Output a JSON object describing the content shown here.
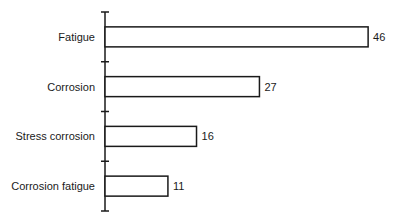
{
  "chart_data": {
    "type": "bar",
    "orientation": "horizontal",
    "title": "",
    "xlabel": "",
    "ylabel": "",
    "categories": [
      "Fatigue",
      "Corrosion",
      "Stress corrosion",
      "Corrosion fatigue"
    ],
    "values": [
      46,
      27,
      16,
      11
    ],
    "value_labels": [
      "46",
      "27",
      "16",
      "11"
    ],
    "xlim": [
      0,
      50
    ],
    "grid": false,
    "legend": null,
    "bar_fill": "#ffffff",
    "bar_stroke": "#1a1a1a"
  }
}
